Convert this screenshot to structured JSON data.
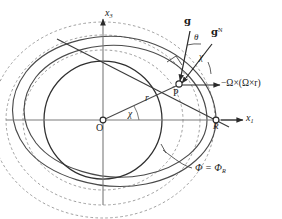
{
  "figure": {
    "kind": "geodetic-equipotential-diagram",
    "axes": {
      "vertical_label": "x",
      "vertical_sub": "3",
      "horizontal_label": "x",
      "horizontal_sub": "1"
    },
    "points": [
      {
        "id": "origin",
        "label": "O",
        "x": 103,
        "y": 120
      },
      {
        "id": "surface-point",
        "label": "P",
        "x": 178,
        "y": 85
      },
      {
        "id": "reference-point",
        "label": "R",
        "x": 216,
        "y": 120
      }
    ],
    "vectors": [
      {
        "id": "gravity",
        "label": "g",
        "style": "fraktur",
        "x": 186,
        "y": 22
      },
      {
        "id": "normal-gravity",
        "label": "g",
        "sup": "N",
        "style": "fraktur",
        "x": 214,
        "y": 33
      },
      {
        "id": "centrifugal",
        "label": "−Ω×(Ω×r)",
        "x": 222,
        "y": 68
      }
    ],
    "angles": [
      {
        "id": "deflection",
        "label": "θ",
        "x": 197,
        "y": 38
      },
      {
        "id": "chi-at-point",
        "label": "χ",
        "x": 202,
        "y": 58
      },
      {
        "id": "chi-at-origin",
        "label": "χ",
        "x": 131,
        "y": 115
      }
    ],
    "radius": {
      "id": "radius",
      "label": "r",
      "x": 147,
      "y": 100
    },
    "potential": {
      "id": "potential-surface",
      "label": "Φ = Φ",
      "sub": "R",
      "x": 199,
      "y": 170
    },
    "colors": {
      "ink": "#1a1a1a",
      "solid_curve": "#4a4a4a",
      "dashed_curve": "#8e8e8e",
      "axis": "#7a7a7a"
    }
  }
}
